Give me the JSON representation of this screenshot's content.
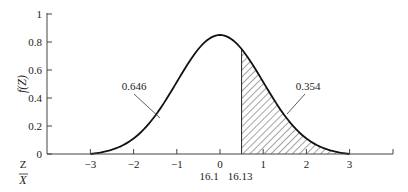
{
  "chart_data": {
    "type": "area",
    "title": "",
    "xlabel": "Z",
    "xlabel_secondary": "X̄",
    "ylabel": "f(Z)",
    "xlim": [
      -4,
      4
    ],
    "ylim": [
      0,
      1
    ],
    "grid": false,
    "x_ticks": [
      -3,
      -2,
      -1,
      0,
      1,
      2,
      3
    ],
    "x_tick_labels": [
      "−3",
      "−2",
      "−1",
      "0",
      "1",
      "2",
      "3"
    ],
    "y_ticks": [
      0,
      0.2,
      0.4,
      0.6,
      0.8,
      1
    ],
    "y_tick_labels": [
      "0",
      "0.2",
      "0.4",
      "0.6",
      "0.8",
      "1"
    ],
    "secondary_x_labels": [
      "16.1",
      "16.13"
    ],
    "curve": {
      "name": "f(Z)",
      "description": "Bell-shaped density curve centered at 0, peak ≈ 0.85, reaching 0 at ±3",
      "x": [
        -3,
        -2.5,
        -2,
        -1.5,
        -1,
        -0.5,
        0,
        0.5,
        1,
        1.5,
        2,
        2.5,
        3
      ],
      "y": [
        0.0,
        0.037,
        0.115,
        0.276,
        0.516,
        0.75,
        0.85,
        0.75,
        0.516,
        0.276,
        0.115,
        0.037,
        0.0
      ]
    },
    "shaded_region": {
      "from": 0.5,
      "to": 3,
      "pattern": "diagonal-hatch",
      "area": 0.354
    },
    "annotations": [
      {
        "text": "0.646",
        "target_region": "left of z=0.5 (unshaded)"
      },
      {
        "text": "0.354",
        "target_region": "right of z=0.5 (hatched)"
      }
    ]
  }
}
